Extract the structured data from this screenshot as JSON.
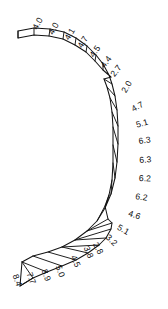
{
  "figure": {
    "type": "annotated-curved-strip-diagram",
    "title": "",
    "background_color": "#ffffff",
    "stroke_color": "#141414",
    "label_color": "#0d0d0d"
  },
  "chart_data": {
    "type": "table",
    "title": "",
    "xlabel": "",
    "ylabel": "",
    "categories": [
      "s1",
      "s2",
      "s3",
      "s4",
      "s5",
      "s6",
      "s7",
      "s8",
      "s9",
      "s10",
      "s11",
      "s12",
      "s13",
      "s14",
      "s15",
      "s16",
      "s17",
      "s18",
      "s19",
      "s20",
      "s21",
      "s22",
      "s23",
      "s24"
    ],
    "values": [
      4.0,
      4.0,
      4.1,
      4.7,
      4.5,
      4.4,
      2.7,
      2.0,
      4.7,
      5.1,
      6.3,
      6.3,
      6.2,
      6.2,
      4.6,
      5.1,
      3.2,
      2.8,
      3.8,
      4.5,
      5.0,
      8.9,
      7.7,
      8.4
    ],
    "legend": [],
    "grid": false
  },
  "labels": [
    {
      "id": "label-4-0-a",
      "text": "4.0",
      "x": 31,
      "y": 27,
      "rot": -62
    },
    {
      "id": "label-4-0-b",
      "text": "4.0",
      "x": 47,
      "y": 32,
      "rot": -62
    },
    {
      "id": "label-4-1",
      "text": "4.1",
      "x": 63,
      "y": 37,
      "rot": -58
    },
    {
      "id": "label-4-7-a",
      "text": "4.7",
      "x": 76,
      "y": 45,
      "rot": -58
    },
    {
      "id": "label-4-5-a",
      "text": "4.5",
      "x": 88,
      "y": 54,
      "rot": -55
    },
    {
      "id": "label-4-4",
      "text": "4.4",
      "x": 99,
      "y": 64,
      "rot": -52
    },
    {
      "id": "label-2-7",
      "text": "2.7",
      "x": 109,
      "y": 73,
      "rot": -52
    },
    {
      "id": "label-2-0",
      "text": "2.0",
      "x": 120,
      "y": 90,
      "rot": -60
    },
    {
      "id": "label-4-7-b",
      "text": "4.7",
      "x": 130,
      "y": 106,
      "rot": -30
    },
    {
      "id": "label-5-1-a",
      "text": "5.1",
      "x": 135,
      "y": 121,
      "rot": -16
    },
    {
      "id": "label-6-3-a",
      "text": "6.3",
      "x": 138,
      "y": 137,
      "rot": -8
    },
    {
      "id": "label-6-3-b",
      "text": "6.3",
      "x": 139,
      "y": 156,
      "rot": -4
    },
    {
      "id": "label-6-2-a",
      "text": "6.2",
      "x": 139,
      "y": 174,
      "rot": 2
    },
    {
      "id": "label-6-2-b",
      "text": "6.2",
      "x": 136,
      "y": 192,
      "rot": 9
    },
    {
      "id": "label-4-6",
      "text": "4.6",
      "x": 130,
      "y": 209,
      "rot": 18
    },
    {
      "id": "label-5-1-b",
      "text": "5.1",
      "x": 120,
      "y": 223,
      "rot": 30
    },
    {
      "id": "label-3-2",
      "text": "3.2",
      "x": 110,
      "y": 233,
      "rot": 43
    },
    {
      "id": "label-2-8",
      "text": "2.8",
      "x": 99,
      "y": 241,
      "rot": 62
    },
    {
      "id": "label-3-8",
      "text": "3.8",
      "x": 90,
      "y": 245,
      "rot": 66
    },
    {
      "id": "label-4-5-b",
      "text": "4.5",
      "x": 77,
      "y": 254,
      "rot": 66
    },
    {
      "id": "label-5-0",
      "text": "5.0",
      "x": 62,
      "y": 264,
      "rot": 70
    },
    {
      "id": "label-8-9",
      "text": "8.9",
      "x": 48,
      "y": 268,
      "rot": 70
    },
    {
      "id": "label-7-7",
      "text": "7.7",
      "x": 33,
      "y": 271,
      "rot": 70
    },
    {
      "id": "label-8-4",
      "text": "8.4",
      "x": 19,
      "y": 273,
      "rot": 70
    }
  ]
}
